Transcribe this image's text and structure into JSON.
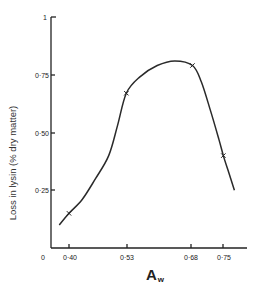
{
  "chart_data": {
    "type": "line",
    "title": "",
    "xlabel": "A",
    "xlabel_subscript": "w",
    "ylabel": "Loss in lysin (% dry matter)",
    "x_ticks": [
      "0",
      "0·40",
      "0·53",
      "0·68",
      "0·75"
    ],
    "y_ticks": [
      "0·25",
      "0·50",
      "0·75",
      "1"
    ],
    "ylim": [
      0,
      1
    ],
    "xlim": [
      0.375,
      0.78
    ],
    "x_axis_broken": true,
    "grid": false,
    "legend": null,
    "markers": {
      "symbol": "x",
      "x": [
        0.4,
        0.53,
        0.68,
        0.75
      ],
      "y": [
        0.15,
        0.67,
        0.79,
        0.4
      ]
    },
    "curve": {
      "x": [
        0.378,
        0.4,
        0.43,
        0.46,
        0.49,
        0.51,
        0.53,
        0.56,
        0.6,
        0.64,
        0.68,
        0.7,
        0.72,
        0.74,
        0.75,
        0.76,
        0.775
      ],
      "y": [
        0.1,
        0.15,
        0.21,
        0.3,
        0.4,
        0.53,
        0.67,
        0.74,
        0.79,
        0.81,
        0.79,
        0.72,
        0.6,
        0.47,
        0.4,
        0.34,
        0.25
      ]
    }
  }
}
